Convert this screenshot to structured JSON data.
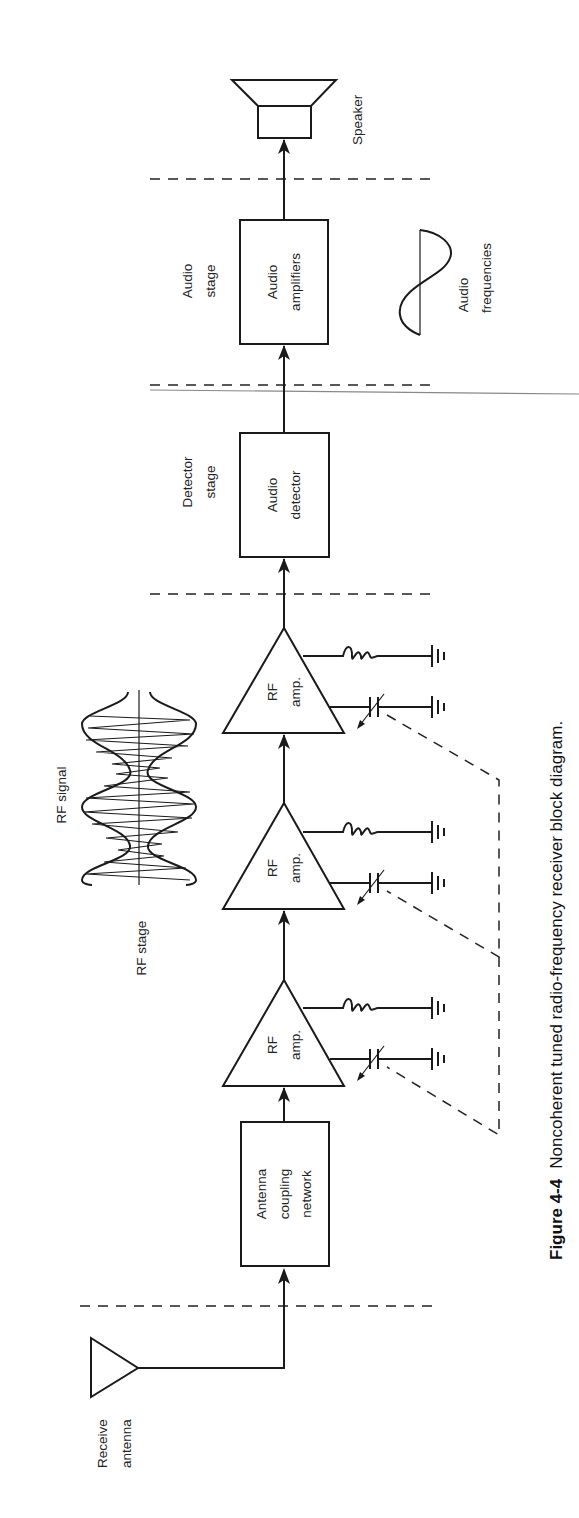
{
  "figure": {
    "number": "Figure 4-4",
    "caption": "Noncoherent tuned radio-frequency receiver block diagram."
  },
  "blocks": {
    "antenna": {
      "line1": "Receive",
      "line2": "antenna"
    },
    "coupling": {
      "line1": "Antenna",
      "line2": "coupling",
      "line3": "network"
    },
    "rf_amp_1": {
      "line1": "RF",
      "line2": "amp."
    },
    "rf_amp_2": {
      "line1": "RF",
      "line2": "amp."
    },
    "rf_amp_3": {
      "line1": "RF",
      "line2": "amp."
    },
    "detector": {
      "line1": "Audio",
      "line2": "detector"
    },
    "amplifiers": {
      "line1": "Audio",
      "line2": "amplifiers"
    },
    "speaker": {
      "label": "Speaker"
    }
  },
  "stages": {
    "rf": {
      "label": "RF stage"
    },
    "detector": {
      "line1": "Detector",
      "line2": "stage"
    },
    "audio": {
      "line1": "Audio",
      "line2": "stage"
    }
  },
  "waveforms": {
    "rf_signal": {
      "label": "RF signal"
    },
    "audio": {
      "line1": "Audio",
      "line2": "frequencies"
    }
  },
  "colors": {
    "ink": "#1a1a1a",
    "background": "#ffffff"
  }
}
